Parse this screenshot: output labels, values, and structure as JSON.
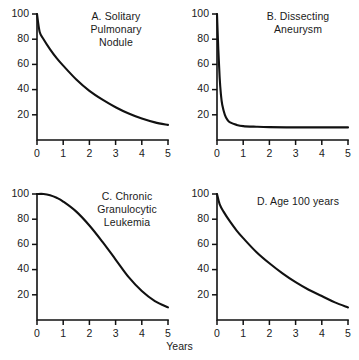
{
  "figure": {
    "xaxis_title": "Years",
    "background": "#ffffff",
    "line_color": "#111111"
  },
  "chart_data": [
    {
      "type": "line",
      "panel": "A",
      "title": "A. Solitary\nPulmonary\nNodule",
      "title_lines": [
        "A. Solitary",
        "Pulmonary",
        "Nodule"
      ],
      "xlabel": "Years",
      "ylabel": "",
      "xlim": [
        0,
        5
      ],
      "ylim": [
        0,
        100
      ],
      "xticks": [
        0,
        1,
        2,
        3,
        4,
        5
      ],
      "yticks": [
        20,
        40,
        60,
        80,
        100
      ],
      "grid": false,
      "legend": "none",
      "x": [
        0,
        0.1,
        0.25,
        0.5,
        0.75,
        1,
        1.5,
        2,
        2.5,
        3,
        3.5,
        4,
        4.5,
        5
      ],
      "values": [
        100,
        86,
        80,
        72,
        65,
        59,
        48,
        39,
        32,
        26,
        21,
        17,
        14,
        12
      ]
    },
    {
      "type": "line",
      "panel": "B",
      "title": "B. Dissecting\nAneurysm",
      "title_lines": [
        "B. Dissecting",
        "Aneurysm"
      ],
      "xlabel": "Years",
      "ylabel": "",
      "xlim": [
        0,
        5
      ],
      "ylim": [
        0,
        100
      ],
      "xticks": [
        0,
        1,
        2,
        3,
        4,
        5
      ],
      "yticks": [
        20,
        40,
        60,
        80,
        100
      ],
      "grid": false,
      "legend": "none",
      "x": [
        0,
        0.05,
        0.1,
        0.15,
        0.2,
        0.3,
        0.4,
        0.5,
        0.75,
        1,
        1.5,
        2,
        3,
        4,
        5
      ],
      "values": [
        100,
        72,
        50,
        36,
        28,
        20,
        16,
        14,
        12,
        11,
        10.5,
        10.2,
        10,
        10,
        10
      ]
    },
    {
      "type": "line",
      "panel": "C",
      "title": "C. Chronic\nGranulocytic\nLeukemia",
      "title_lines": [
        "C. Chronic",
        "Granulocytic",
        "Leukemia"
      ],
      "xlabel": "Years",
      "ylabel": "",
      "xlim": [
        0,
        5
      ],
      "ylim": [
        0,
        100
      ],
      "xticks": [
        0,
        1,
        2,
        3,
        4,
        5
      ],
      "yticks": [
        20,
        40,
        60,
        80,
        100
      ],
      "grid": false,
      "legend": "none",
      "x": [
        0,
        0.25,
        0.5,
        0.75,
        1,
        1.5,
        2,
        2.5,
        3,
        3.5,
        4,
        4.5,
        5
      ],
      "values": [
        100,
        100,
        99,
        97,
        94,
        86,
        75,
        62,
        48,
        34,
        23,
        15,
        10
      ]
    },
    {
      "type": "line",
      "panel": "D",
      "title": "D. Age 100 years",
      "title_lines": [
        "D. Age 100 years"
      ],
      "xlabel": "Years",
      "ylabel": "",
      "xlim": [
        0,
        5
      ],
      "ylim": [
        0,
        100
      ],
      "xticks": [
        0,
        1,
        2,
        3,
        4,
        5
      ],
      "yticks": [
        20,
        40,
        60,
        80,
        100
      ],
      "grid": false,
      "legend": "none",
      "x": [
        0,
        0.1,
        0.25,
        0.5,
        0.75,
        1,
        1.5,
        2,
        2.5,
        3,
        3.5,
        4,
        4.5,
        5
      ],
      "values": [
        100,
        92,
        86,
        78,
        71,
        65,
        54,
        45,
        37,
        30,
        24,
        19,
        14,
        10
      ]
    }
  ]
}
